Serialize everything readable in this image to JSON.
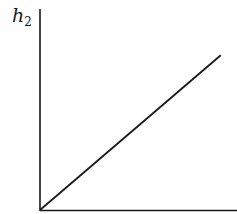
{
  "chart_data": {
    "type": "line",
    "title": "",
    "xlabel": "",
    "ylabel": "h2",
    "ylabel_display": {
      "base": "h",
      "subscript": "2"
    },
    "grid": false,
    "legend": null,
    "x_ticks": [],
    "y_ticks": [],
    "series": [
      {
        "name": "h2",
        "x": [
          0,
          1
        ],
        "y": [
          0,
          0.77
        ],
        "color": "#1a1a1a"
      }
    ],
    "xlim": [
      0,
      1.09
    ],
    "ylim": [
      0,
      1.0
    ]
  }
}
